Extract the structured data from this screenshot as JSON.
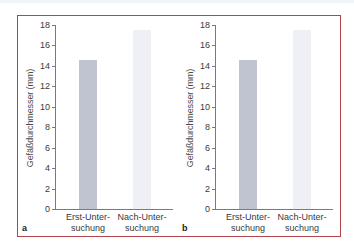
{
  "chart_data": [
    {
      "panel": "a",
      "type": "bar",
      "title": "",
      "xlabel": "",
      "ylabel": "Gefäßdurchmesser (mm)",
      "categories": [
        "Erst-Unter-\nsuchung",
        "Nach-Unter-\nsuchung"
      ],
      "category_lines": [
        [
          "Erst-Unter-",
          "suchung"
        ],
        [
          "Nach-Unter-",
          "suchung"
        ]
      ],
      "values": [
        14.6,
        17.5
      ],
      "bar_colors": [
        "#c0c4d0",
        "#eef0f6"
      ],
      "ylim": [
        0,
        18
      ],
      "yticks": [
        0,
        2,
        4,
        6,
        8,
        10,
        12,
        14,
        16,
        18
      ],
      "grid": false,
      "legend": null
    },
    {
      "panel": "b",
      "type": "bar",
      "title": "",
      "xlabel": "",
      "ylabel": "Gefäßdurchmesser (mm)",
      "categories": [
        "Erst-Unter-\nsuchung",
        "Nach-Unter-\nsuchung"
      ],
      "category_lines": [
        [
          "Erst-Unter-",
          "suchung"
        ],
        [
          "Nach-Unter-",
          "suchung"
        ]
      ],
      "values": [
        14.6,
        17.5
      ],
      "bar_colors": [
        "#c0c4d0",
        "#eef0f6"
      ],
      "ylim": [
        0,
        18
      ],
      "yticks": [
        0,
        2,
        4,
        6,
        8,
        10,
        12,
        14,
        16,
        18
      ],
      "grid": false,
      "legend": null
    }
  ],
  "panels": [
    {
      "letter": "a"
    },
    {
      "letter": "b"
    }
  ],
  "colors": {
    "frame_border": "#b5454a",
    "axis": "#7a7a7a"
  }
}
